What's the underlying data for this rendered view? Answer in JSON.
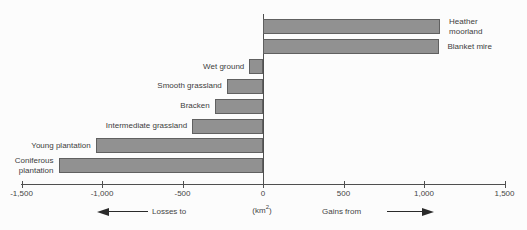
{
  "chart_data": {
    "type": "bar",
    "orientation": "horizontal-diverging",
    "title": "",
    "xlabel_unit": {
      "prefix": "(km",
      "sup": "2",
      "suffix": ")"
    },
    "categories": [
      "Heather moorland",
      "Blanket mire",
      "Wet ground",
      "Smooth grassland",
      "Bracken",
      "Intermediate grassland",
      "Young plantation",
      "Coniferous plantation"
    ],
    "category_label_lines": [
      [
        "Heather",
        "moorland"
      ],
      [
        "Blanket mire"
      ],
      [
        "Wet ground"
      ],
      [
        "Smooth grassland"
      ],
      [
        "Bracken"
      ],
      [
        "Intermediate grassland"
      ],
      [
        "Young plantation"
      ],
      [
        "Coniferous",
        "plantation"
      ]
    ],
    "values": [
      1100,
      1090,
      -85,
      -225,
      -300,
      -440,
      -1040,
      -1270
    ],
    "xlim": [
      -1500,
      1500
    ],
    "x_ticks": [
      -1500,
      -1000,
      -500,
      0,
      500,
      1000,
      1500
    ],
    "x_tick_labels": [
      "-1,500",
      "-1,000",
      "-500",
      "0",
      "500",
      "1,000",
      "1,500"
    ],
    "grid": false,
    "legend": false,
    "annotations": {
      "losses_label": "Losses to",
      "gains_label": "Gains from"
    }
  },
  "colors": {
    "bar_fill": "#919191",
    "bar_border": "#606060",
    "axis": "#4f4f4f",
    "text": "#3d3d3d",
    "background": "#fcfcfc"
  }
}
